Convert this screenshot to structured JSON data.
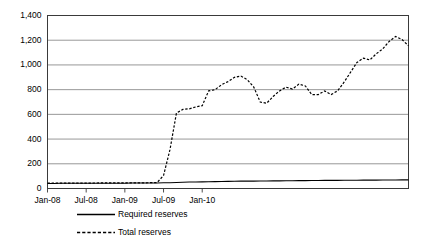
{
  "chart_data": {
    "type": "line",
    "title": "",
    "subtitle": "",
    "xlabel": "",
    "ylabel": "",
    "grid": true,
    "legend_position": "bottom-left",
    "xlim": [
      "Jan-08",
      "Apr-10"
    ],
    "ylim": [
      0,
      1400
    ],
    "ytick_values": [
      0,
      200,
      400,
      600,
      800,
      1000,
      1200,
      1400
    ],
    "ytick_labels": [
      "0",
      "200",
      "400",
      "600",
      "800",
      "1,000",
      "1,200",
      "1,400"
    ],
    "xtick_labels": [
      "Jan-08",
      "Jul-08",
      "Jan-09",
      "Jul-09",
      "Jan-10"
    ],
    "xtick_positions": [
      0,
      6,
      12,
      18,
      24
    ],
    "x_unit": "month index from Jan-08",
    "x_count": 57,
    "series": [
      {
        "name": "Required reserves",
        "style": "solid",
        "color": "#000000",
        "values": [
          41,
          41,
          42,
          42,
          43,
          43,
          43,
          43,
          43,
          43,
          43,
          43,
          43,
          44,
          44,
          44,
          45,
          45,
          46,
          47,
          48,
          50,
          52,
          53,
          54,
          55,
          56,
          57,
          58,
          59,
          60,
          60,
          60,
          61,
          61,
          62,
          62,
          63,
          63,
          64,
          64,
          65,
          65,
          66,
          66,
          66,
          67,
          67,
          67,
          68,
          68,
          68,
          69,
          69,
          69,
          70,
          70
        ]
      },
      {
        "name": "Total reserves",
        "style": "dashed",
        "color": "#000000",
        "values": [
          43,
          43,
          44,
          44,
          44,
          44,
          44,
          44,
          45,
          45,
          45,
          45,
          45,
          46,
          46,
          46,
          47,
          48,
          105,
          315,
          610,
          640,
          645,
          660,
          670,
          790,
          800,
          840,
          865,
          900,
          910,
          880,
          820,
          700,
          690,
          745,
          790,
          820,
          805,
          845,
          830,
          760,
          760,
          790,
          760,
          790,
          860,
          940,
          1020,
          1055,
          1040,
          1090,
          1130,
          1190,
          1230,
          1205,
          1155
        ]
      }
    ]
  },
  "axes": {
    "y_axis_name": "reserves-axis",
    "x_axis_name": "date-axis"
  },
  "legend": {
    "entries": [
      {
        "label": "Required reserves",
        "style": "solid"
      },
      {
        "label": "Total reserves",
        "style": "dashed"
      }
    ]
  }
}
